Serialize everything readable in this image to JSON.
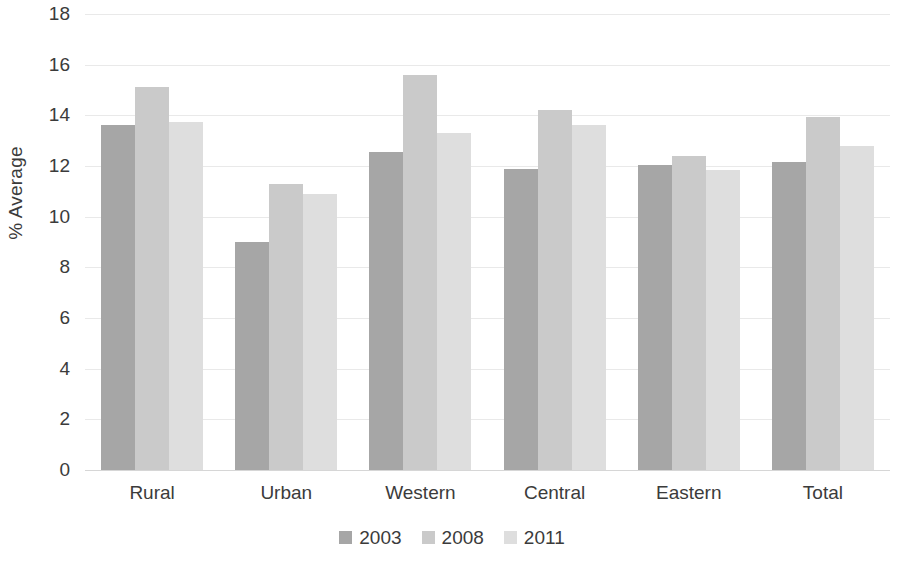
{
  "chart_data": {
    "type": "bar",
    "title": "",
    "subtitle": "",
    "xlabel": "",
    "ylabel": "% Average",
    "ylim": [
      0,
      18
    ],
    "ytick_step": 2,
    "yticks": [
      18,
      16,
      14,
      12,
      10,
      8,
      6,
      4,
      2,
      0
    ],
    "grid": true,
    "grid_axis": "y",
    "legend_position": "bottom",
    "categories": [
      "Rural",
      "Urban",
      "Western",
      "Central",
      "Eastern",
      "Total"
    ],
    "series": [
      {
        "name": "2003",
        "color": "#a6a6a6",
        "values": [
          13.6,
          9.0,
          12.55,
          11.9,
          12.05,
          12.15
        ]
      },
      {
        "name": "2008",
        "color": "#cacaca",
        "values": [
          15.1,
          11.3,
          15.6,
          14.2,
          12.4,
          13.95
        ]
      },
      {
        "name": "2011",
        "color": "#dedede",
        "values": [
          13.75,
          10.9,
          13.3,
          13.6,
          11.85,
          12.8
        ]
      }
    ]
  },
  "legend": {
    "items": [
      {
        "label": "2003",
        "color": "#a6a6a6"
      },
      {
        "label": "2008",
        "color": "#cacaca"
      },
      {
        "label": "2011",
        "color": "#dedede"
      }
    ]
  },
  "axes": {
    "y_title": "% Average"
  }
}
